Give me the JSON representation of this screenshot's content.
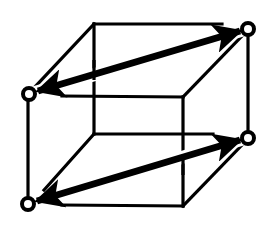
{
  "diagram": {
    "type": "wireframe-cube",
    "colors": {
      "stroke": "#000000",
      "background": "#ffffff",
      "node_fill": "#ffffff"
    },
    "vertices": {
      "back_top_left": [
        94,
        24
      ],
      "back_top_right": [
        248,
        29
      ],
      "front_top_left": [
        29,
        94
      ],
      "front_top_right": [
        183,
        97
      ],
      "back_bottom_left": [
        94,
        134
      ],
      "back_bottom_right": [
        248,
        138
      ],
      "front_bottom_left": [
        28,
        204
      ],
      "front_bottom_right": [
        183,
        206
      ]
    },
    "marked_nodes": [
      "back_top_right",
      "front_top_left",
      "back_bottom_right",
      "front_bottom_left"
    ],
    "arrows": [
      {
        "from": "front_top_left",
        "to": "back_top_right",
        "style": "double-headed"
      },
      {
        "from": "front_bottom_left",
        "to": "back_bottom_right",
        "style": "double-headed"
      }
    ]
  }
}
